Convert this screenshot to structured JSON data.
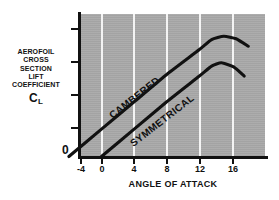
{
  "chart_data": {
    "type": "line",
    "title": "",
    "xlabel": "ANGLE OF ATTACK",
    "ylabel": "AEROFOIL CROSS SECTION LIFT COEFFICIENT CL",
    "xticks": [
      "-4",
      "0",
      "4",
      "8",
      "12",
      "16"
    ],
    "xlim": [
      -4,
      19
    ],
    "ylim": [
      0,
      1.55
    ],
    "yticks": [
      "0"
    ],
    "y_tick_count_unlabeled": 4,
    "grid": "vertical white gridlines at each x tick",
    "legend": "inline labels drawn along each curve",
    "plot_background": "#a9a9a9",
    "series": [
      {
        "name": "CAMBERED",
        "label_position": "along curve, rotated -38 degrees",
        "points": [
          {
            "x": -4,
            "y": 0.0
          },
          {
            "x": 0,
            "y": 0.33
          },
          {
            "x": 4,
            "y": 0.66
          },
          {
            "x": 8,
            "y": 0.99
          },
          {
            "x": 12,
            "y": 1.29
          },
          {
            "x": 13.5,
            "y": 1.41
          },
          {
            "x": 15,
            "y": 1.45
          },
          {
            "x": 16.5,
            "y": 1.42
          },
          {
            "x": 18,
            "y": 1.33
          }
        ]
      },
      {
        "name": "SYMMETRICAL",
        "label_position": "along curve, rotated -38 degrees",
        "points": [
          {
            "x": 0,
            "y": 0.0
          },
          {
            "x": 4,
            "y": 0.33
          },
          {
            "x": 8,
            "y": 0.66
          },
          {
            "x": 12,
            "y": 0.97
          },
          {
            "x": 13.5,
            "y": 1.09
          },
          {
            "x": 14.7,
            "y": 1.13
          },
          {
            "x": 16.2,
            "y": 1.08
          },
          {
            "x": 17.5,
            "y": 0.97
          }
        ]
      }
    ]
  },
  "axes": {
    "y_caption_lines": [
      "AEROFOIL",
      "CROSS",
      "SECTION",
      "LIFT",
      "COEFFICIENT"
    ],
    "y_caption_symbol": "C",
    "y_caption_subscript": "L",
    "y_origin_label": "0",
    "x_title": "ANGLE OF ATTACK",
    "x_tick_labels": [
      "-4",
      "0",
      "4",
      "8",
      "12",
      "16"
    ]
  },
  "series_labels": {
    "cambered": "CAMBERED",
    "symmetrical": "SYMMETRICAL"
  },
  "colors": {
    "plot_background": "#a9a9a9",
    "gridline": "#f4f4f4",
    "ink": "#111111",
    "page": "#ffffff"
  }
}
